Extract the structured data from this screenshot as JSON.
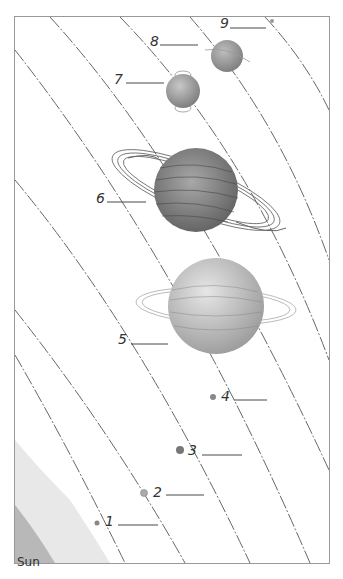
{
  "diagram": {
    "sun_label": "Sun",
    "planets": [
      {
        "number": "1",
        "x": 97,
        "y": 523,
        "r": 2.5
      },
      {
        "number": "2",
        "x": 144,
        "y": 493,
        "r": 3.5
      },
      {
        "number": "3",
        "x": 180,
        "y": 450,
        "r": 4
      },
      {
        "number": "4",
        "x": 213,
        "y": 397,
        "r": 3
      },
      {
        "number": "5",
        "x": 216,
        "y": 306,
        "r": 48
      },
      {
        "number": "6",
        "x": 196,
        "y": 190,
        "r": 42
      },
      {
        "number": "7",
        "x": 183,
        "y": 91,
        "r": 17
      },
      {
        "number": "8",
        "x": 227,
        "y": 56,
        "r": 16
      },
      {
        "number": "9",
        "x": 272,
        "y": 21,
        "r": 2
      }
    ],
    "colors": {
      "line": "#555555",
      "planet": "#8a8a8a",
      "planet_light": "#c8c8c8",
      "sun": "#bdbdbd",
      "border": "#999999"
    }
  }
}
